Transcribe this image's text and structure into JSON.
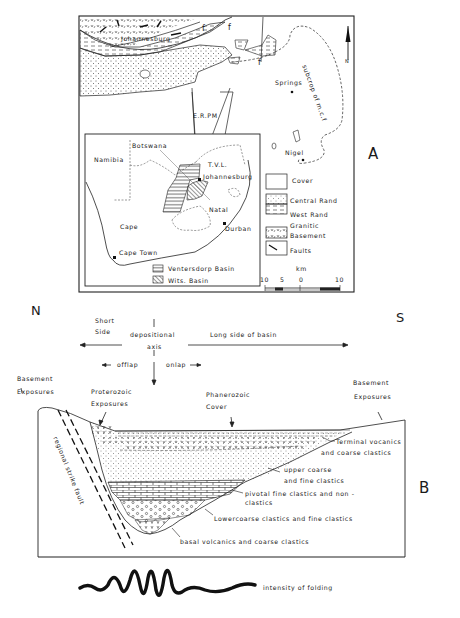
{
  "figure": {
    "panel_a": {
      "panel_label": "A",
      "north_label": "N",
      "places": {
        "johannesburg_top": "Johannesburg",
        "springs": "Springs",
        "nigel": "Nigel",
        "erpm": "E.R.PM",
        "subcrop": "subcrop of m.c.f"
      },
      "fault_marker": "f",
      "inset": {
        "botswana": "Botswana",
        "namibia": "Namibia",
        "tvl": "T.V.L.",
        "johannesburg": "Johannesburg",
        "natal": "Natal",
        "durban": "Durban",
        "cape": "Cape",
        "cape_town": "Cape Town",
        "legend": [
          {
            "label": "Ventersdorp Basin",
            "pattern": "horizontal-hatch"
          },
          {
            "label": "Wits. Basin",
            "pattern": "diagonal-hatch"
          }
        ]
      },
      "legend": [
        {
          "label": "Cover",
          "pattern": "blank"
        },
        {
          "label": "Central Rand",
          "pattern": "dotted"
        },
        {
          "label": "West Rand",
          "pattern": "dashed"
        },
        {
          "label": "Granitic",
          "label2": "Basement",
          "pattern": "v-marks"
        },
        {
          "label": "Faults",
          "pattern": "fault-line"
        }
      ],
      "scale": {
        "unit": "km",
        "ticks": [
          "10",
          "5",
          "0",
          "10"
        ]
      }
    },
    "panel_b": {
      "panel_label": "B",
      "north": "N",
      "south": "S",
      "short_side": "Short",
      "short_side2": "Side",
      "depositional_axis": "depositional",
      "depositional_axis2": "axis",
      "long_side": "Long side of basin",
      "offlap": "offlap",
      "onlap": "onlap",
      "basement_exposures_left": "Basement",
      "basement_exposures_left2": "Exposures",
      "proterozoic": "Proterozoic",
      "proterozoic2": "Exposures",
      "phanerozoic": "Phanerozoic",
      "phanerozoic2": "Cover",
      "basement_exposures_right": "Basement",
      "basement_exposures_right2": "Exposures",
      "fault_label": "regional strike fault",
      "units": [
        {
          "label": "Terminal vocanics",
          "label2": "and coarse clastics"
        },
        {
          "label": "upper  coarse",
          "label2": "and fine clastics"
        },
        {
          "label": "pivotal fine clastics and non -",
          "label2": "clastics"
        },
        {
          "label": "Lowercoarse clastics and fine clastics"
        },
        {
          "label": "basal volcanics and coarse clastics"
        }
      ],
      "folding_label": "intensity of folding"
    }
  }
}
